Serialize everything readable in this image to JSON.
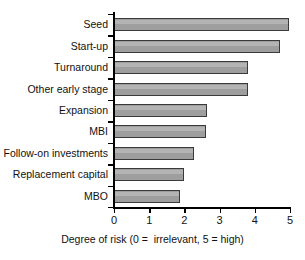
{
  "chart_data": {
    "type": "bar",
    "orientation": "horizontal",
    "title": "",
    "xlabel": "Degree of risk (0 =  irrelevant, 5 = high)",
    "ylabel": "",
    "xlim": [
      0,
      5
    ],
    "xticks": [
      "0",
      "1",
      "2",
      "3",
      "4",
      "5"
    ],
    "grid": false,
    "legend": false,
    "categories": [
      "Seed",
      "Start-up",
      "Turnaround",
      "Other early stage",
      "Expansion",
      "MBI",
      "Follow-on investments",
      "Replacement capital",
      "MBO"
    ],
    "values": [
      4.97,
      4.72,
      3.8,
      3.8,
      2.64,
      2.61,
      2.27,
      1.98,
      1.88
    ],
    "bar_fill_color": "#9e9e9e",
    "bar_edge_color": "#3a3a3a"
  }
}
